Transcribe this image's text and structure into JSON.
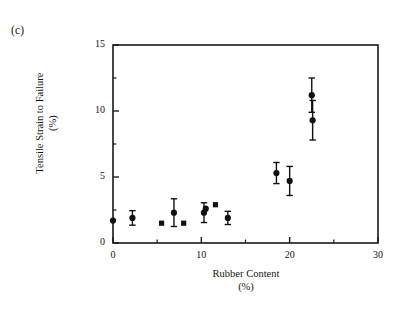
{
  "figure": {
    "panel_label": "(c)",
    "background_color": "#ffffff",
    "ink_color": "#1a1a1a"
  },
  "chart_data": {
    "type": "scatter",
    "title": "",
    "panel": "(c)",
    "xlabel": "Rubber Content\n(%)",
    "ylabel": "Tensile Strain to Failure\n(%)",
    "xlim": [
      0,
      30
    ],
    "ylim": [
      0,
      15
    ],
    "xticks": [
      0,
      10,
      20,
      30
    ],
    "xticklabels": [
      "0",
      "10",
      "20",
      "30"
    ],
    "xminorticks": [
      5,
      15,
      25
    ],
    "yticks": [
      0,
      5,
      10,
      15
    ],
    "yticklabels": [
      "0",
      "5",
      "10",
      "15"
    ],
    "yminorticks": [
      2.5,
      7.5,
      12.5
    ],
    "grid": false,
    "legend": null,
    "series": [
      {
        "name": "Tensile strain to failure",
        "marker": "circle",
        "color": "#111111",
        "points": [
          {
            "x": 0.0,
            "y": 1.7,
            "yerr": 0.0,
            "marker": "circle"
          },
          {
            "x": 2.2,
            "y": 1.9,
            "yerr": 0.55,
            "marker": "circle"
          },
          {
            "x": 5.5,
            "y": 1.5,
            "yerr": 0.0,
            "marker": "square"
          },
          {
            "x": 8.0,
            "y": 1.5,
            "yerr": 0.0,
            "marker": "square"
          },
          {
            "x": 6.9,
            "y": 2.3,
            "yerr": 1.05,
            "marker": "circle"
          },
          {
            "x": 10.3,
            "y": 2.3,
            "yerr": 0.75,
            "marker": "circle"
          },
          {
            "x": 10.5,
            "y": 2.6,
            "yerr": 0.0,
            "marker": "circle"
          },
          {
            "x": 11.6,
            "y": 2.9,
            "yerr": 0.0,
            "marker": "square"
          },
          {
            "x": 13.0,
            "y": 1.9,
            "yerr": 0.5,
            "marker": "circle"
          },
          {
            "x": 18.5,
            "y": 5.3,
            "yerr": 0.8,
            "marker": "circle"
          },
          {
            "x": 20.0,
            "y": 4.7,
            "yerr": 1.1,
            "marker": "circle"
          },
          {
            "x": 22.5,
            "y": 11.2,
            "yerr": 1.3,
            "marker": "circle"
          },
          {
            "x": 22.6,
            "y": 9.3,
            "yerr": 1.5,
            "marker": "circle"
          }
        ]
      }
    ]
  }
}
